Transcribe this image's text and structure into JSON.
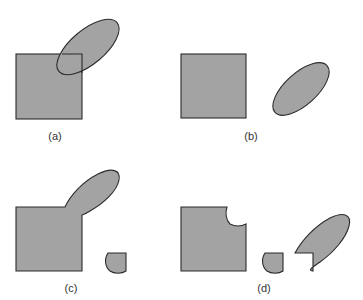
{
  "figure": {
    "panels": [
      {
        "id": "a",
        "label": "(a)",
        "description": "square and ellipse overlapping"
      },
      {
        "id": "b",
        "label": "(b)",
        "description": "square and ellipse separated"
      },
      {
        "id": "c",
        "label": "(c)",
        "description": "union of square and ellipse plus separate intersection piece"
      },
      {
        "id": "d",
        "label": "(d)",
        "description": "square minus intersection, intersection piece, ellipse minus intersection"
      }
    ],
    "colors": {
      "fill": "#a3a3a3",
      "stroke": "#2b2b2b",
      "background": "#ffffff"
    }
  }
}
